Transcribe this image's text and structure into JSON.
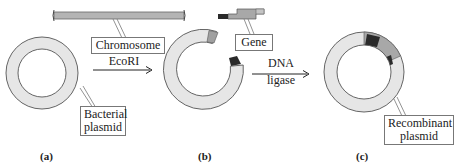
{
  "labels": {
    "chromosome": "Chromosome",
    "gene": "Gene",
    "bacterial_plasmid_line1": "Bacterial",
    "bacterial_plasmid_line2": "plasmid",
    "recombinant_plasmid_line1": "Recombinant",
    "recombinant_plasmid_line2": "plasmid"
  },
  "arrows": {
    "step1": "EcoRI",
    "step2_line1": "DNA",
    "step2_line2": "ligase"
  },
  "panels": {
    "a": "(a)",
    "b": "(b)",
    "c": "(c)"
  },
  "colors": {
    "plasmid_fill": "#e6e6e6",
    "plasmid_stroke": "#555555",
    "gene_fill": "#a8a8a8",
    "sticky_end_dark": "#2a2a2a",
    "chromosome_fill": "#b4b4b4"
  }
}
